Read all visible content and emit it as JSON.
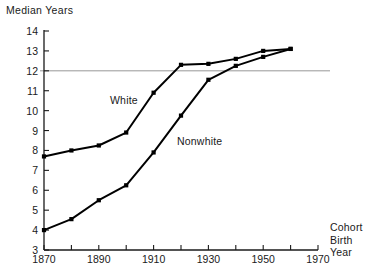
{
  "chart_data": {
    "type": "line",
    "title": "",
    "ylabel": "Median Years",
    "xlabel": "Cohort Birth Year",
    "xlabel_lines": [
      "Cohort",
      "Birth",
      "Year"
    ],
    "x": [
      1870,
      1880,
      1890,
      1900,
      1910,
      1920,
      1930,
      1940,
      1950,
      1960
    ],
    "xlim": [
      1870,
      1970
    ],
    "ylim": [
      3,
      14
    ],
    "xticks": [
      1870,
      1880,
      1890,
      1900,
      1910,
      1920,
      1930,
      1940,
      1950,
      1960,
      1970
    ],
    "xticklabels_shown": [
      "1870",
      "1890",
      "1910",
      "1930",
      "1950",
      "1970"
    ],
    "yticks": [
      3,
      4,
      5,
      6,
      7,
      8,
      9,
      10,
      11,
      12,
      13,
      14
    ],
    "yticklabels": [
      "3",
      "4",
      "5",
      "6",
      "7",
      "8",
      "9",
      "10",
      "11",
      "12",
      "13",
      "14"
    ],
    "grid": false,
    "reference_line": {
      "y": 12,
      "label": "",
      "color": "#8c8c8c"
    },
    "legend": "inline-annotations",
    "series": [
      {
        "name": "White",
        "color": "#000000",
        "marker": "square",
        "values": [
          7.7,
          8.0,
          8.25,
          8.9,
          10.9,
          12.3,
          12.35,
          12.6,
          13.0,
          13.1
        ]
      },
      {
        "name": "Nonwhite",
        "color": "#000000",
        "marker": "square",
        "values": [
          4.0,
          4.55,
          5.5,
          6.25,
          7.9,
          9.75,
          11.55,
          12.25,
          12.7,
          13.1
        ]
      }
    ],
    "annotations": [
      {
        "text": "White",
        "x_px": 110,
        "y_px": 94
      },
      {
        "text": "Nonwhite",
        "x_px": 177,
        "y_px": 135
      }
    ]
  }
}
